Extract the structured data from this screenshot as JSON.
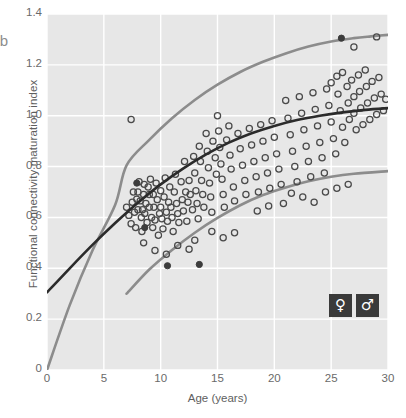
{
  "panel": {
    "letter": "b"
  },
  "axes": {
    "x": {
      "label": "Age (years)",
      "ticks": [
        0,
        5,
        10,
        15,
        20,
        25,
        30
      ],
      "min": 0,
      "max": 30
    },
    "y": {
      "label": "Functional connectivity maturation index",
      "ticks": [
        "0",
        "0.2",
        "0.4",
        "0.6",
        "0.8",
        "1.0",
        "1.2",
        "1.4"
      ],
      "tick_values": [
        0,
        0.2,
        0.4,
        0.6,
        0.8,
        1.0,
        1.2,
        1.4
      ],
      "min": 0,
      "max": 1.4
    }
  },
  "legend": {
    "position": "bottom-right",
    "items": [
      {
        "name": "female",
        "glyph": "♀",
        "box_color": "#3a3a3a",
        "glyph_color": "#ffffff"
      },
      {
        "name": "male",
        "glyph": "♂",
        "box_color": "#3a3a3a",
        "glyph_color": "#ffffff"
      }
    ]
  },
  "style": {
    "plot_background": "#e7e7e7",
    "gridline_color": "#ffffff",
    "page_background": "#ffffff",
    "marker_edge_color": "#4a4a4a",
    "marker_fill": "none",
    "marker_filled_color": "#3c3c3c",
    "marker_radius": 3.1,
    "fit_color": "#2b2b2b",
    "band_color": "#8c8c8c",
    "tick_text_color": "#6a6a6a",
    "axis_label_color": "#5e5e5e"
  },
  "chart_data": {
    "type": "scatter",
    "title": "",
    "subtitle": "",
    "xlabel": "Age (years)",
    "ylabel": "Functional connectivity maturation index",
    "xlim": [
      0,
      30
    ],
    "ylim": [
      0,
      1.4
    ],
    "grid": true,
    "legend_position": "bottom right",
    "legend_entries": [
      "♀",
      "♂"
    ],
    "series": [
      {
        "name": "participants",
        "type": "scatter",
        "marker": "open-circle",
        "points": [
          [
            7.4,
            0.985
          ],
          [
            7.0,
            0.64
          ],
          [
            7.2,
            0.608
          ],
          [
            7.4,
            0.575
          ],
          [
            7.5,
            0.66
          ],
          [
            7.6,
            0.7
          ],
          [
            7.7,
            0.62
          ],
          [
            7.8,
            0.56
          ],
          [
            7.9,
            0.672
          ],
          [
            8.0,
            0.63
          ],
          [
            8.0,
            0.7
          ],
          [
            8.1,
            0.74
          ],
          [
            8.2,
            0.665
          ],
          [
            8.3,
            0.6
          ],
          [
            8.35,
            0.545
          ],
          [
            8.4,
            0.63
          ],
          [
            8.5,
            0.69
          ],
          [
            8.55,
            0.73
          ],
          [
            8.6,
            0.615
          ],
          [
            8.7,
            0.655
          ],
          [
            8.8,
            0.58
          ],
          [
            8.9,
            0.72
          ],
          [
            9.0,
            0.64
          ],
          [
            9.0,
            0.69
          ],
          [
            9.1,
            0.75
          ],
          [
            9.2,
            0.6
          ],
          [
            9.3,
            0.56
          ],
          [
            9.35,
            0.69
          ],
          [
            9.4,
            0.64
          ],
          [
            9.5,
            0.59
          ],
          [
            9.6,
            0.735
          ],
          [
            9.7,
            0.67
          ],
          [
            9.8,
            0.53
          ],
          [
            9.9,
            0.615
          ],
          [
            10.0,
            0.705
          ],
          [
            10.0,
            0.64
          ],
          [
            10.1,
            0.595
          ],
          [
            10.2,
            0.555
          ],
          [
            10.3,
            0.68
          ],
          [
            10.4,
            0.755
          ],
          [
            10.5,
            0.62
          ],
          [
            10.6,
            0.585
          ],
          [
            10.7,
            0.66
          ],
          [
            10.8,
            0.72
          ],
          [
            10.9,
            0.64
          ],
          [
            11.0,
            0.6
          ],
          [
            11.1,
            0.545
          ],
          [
            11.2,
            0.7
          ],
          [
            11.3,
            0.77
          ],
          [
            11.4,
            0.655
          ],
          [
            11.5,
            0.615
          ],
          [
            11.6,
            0.58
          ],
          [
            11.8,
            0.74
          ],
          [
            11.9,
            0.67
          ],
          [
            12.0,
            0.625
          ],
          [
            12.1,
            0.82
          ],
          [
            12.2,
            0.7
          ],
          [
            12.3,
            0.585
          ],
          [
            12.4,
            0.66
          ],
          [
            12.5,
            0.745
          ],
          [
            12.6,
            0.69
          ],
          [
            12.8,
            0.63
          ],
          [
            12.9,
            0.84
          ],
          [
            13.0,
            0.775
          ],
          [
            13.1,
            0.705
          ],
          [
            13.2,
            0.655
          ],
          [
            13.3,
            0.595
          ],
          [
            13.4,
            0.88
          ],
          [
            13.5,
            0.82
          ],
          [
            13.6,
            0.745
          ],
          [
            13.7,
            0.69
          ],
          [
            13.8,
            0.64
          ],
          [
            14.0,
            0.93
          ],
          [
            14.1,
            0.86
          ],
          [
            14.2,
            0.795
          ],
          [
            14.3,
            0.735
          ],
          [
            14.4,
            0.68
          ],
          [
            14.5,
            0.62
          ],
          [
            14.6,
            0.9
          ],
          [
            14.8,
            0.835
          ],
          [
            14.9,
            0.77
          ],
          [
            15.0,
            1.0
          ],
          [
            15.1,
            0.94
          ],
          [
            15.2,
            0.875
          ],
          [
            15.3,
            0.81
          ],
          [
            15.4,
            0.75
          ],
          [
            15.5,
            0.69
          ],
          [
            15.6,
            0.64
          ],
          [
            15.8,
            0.905
          ],
          [
            16.0,
            0.96
          ],
          [
            16.1,
            0.845
          ],
          [
            16.2,
            0.79
          ],
          [
            16.4,
            0.72
          ],
          [
            16.5,
            0.665
          ],
          [
            16.8,
            0.93
          ],
          [
            17.0,
            0.87
          ],
          [
            17.2,
            0.805
          ],
          [
            17.4,
            0.745
          ],
          [
            17.5,
            0.69
          ],
          [
            17.8,
            0.95
          ],
          [
            18.0,
            0.885
          ],
          [
            18.2,
            0.82
          ],
          [
            18.4,
            0.76
          ],
          [
            18.6,
            0.7
          ],
          [
            18.8,
            0.965
          ],
          [
            19.0,
            0.9
          ],
          [
            19.2,
            0.835
          ],
          [
            19.4,
            0.775
          ],
          [
            19.6,
            0.715
          ],
          [
            19.8,
            0.98
          ],
          [
            20.0,
            0.915
          ],
          [
            20.2,
            0.85
          ],
          [
            20.4,
            0.79
          ],
          [
            20.6,
            0.73
          ],
          [
            20.8,
            0.655
          ],
          [
            21.0,
            1.06
          ],
          [
            21.2,
            0.99
          ],
          [
            21.4,
            0.925
          ],
          [
            21.6,
            0.86
          ],
          [
            21.8,
            0.8
          ],
          [
            22.0,
            0.74
          ],
          [
            22.2,
            1.075
          ],
          [
            22.4,
            1.01
          ],
          [
            22.6,
            0.945
          ],
          [
            22.8,
            0.88
          ],
          [
            23.0,
            0.82
          ],
          [
            23.2,
            0.76
          ],
          [
            23.4,
            1.09
          ],
          [
            23.6,
            1.025
          ],
          [
            23.8,
            0.96
          ],
          [
            24.0,
            0.895
          ],
          [
            24.2,
            0.835
          ],
          [
            24.4,
            0.775
          ],
          [
            24.6,
            1.105
          ],
          [
            24.8,
            1.04
          ],
          [
            25.0,
            0.975
          ],
          [
            25.0,
            1.13
          ],
          [
            25.2,
            0.91
          ],
          [
            25.4,
            0.85
          ],
          [
            25.5,
            1.155
          ],
          [
            25.6,
            1.085
          ],
          [
            25.8,
            1.02
          ],
          [
            26.0,
            0.955
          ],
          [
            26.0,
            1.17
          ],
          [
            26.2,
            0.895
          ],
          [
            26.4,
            1.115
          ],
          [
            26.5,
            1.05
          ],
          [
            26.6,
            0.985
          ],
          [
            26.8,
            1.14
          ],
          [
            27.0,
            1.075
          ],
          [
            27.0,
            1.01
          ],
          [
            27.2,
            0.945
          ],
          [
            27.4,
            1.16
          ],
          [
            27.5,
            1.095
          ],
          [
            27.6,
            1.03
          ],
          [
            27.8,
            0.965
          ],
          [
            28.0,
            1.18
          ],
          [
            28.1,
            1.115
          ],
          [
            28.2,
            1.05
          ],
          [
            28.4,
            0.985
          ],
          [
            28.6,
            1.135
          ],
          [
            28.8,
            1.07
          ],
          [
            29.0,
            1.005
          ],
          [
            29.2,
            1.15
          ],
          [
            29.4,
            1.085
          ],
          [
            29.6,
            1.02
          ],
          [
            29.8,
            1.065
          ],
          [
            21.5,
            0.695
          ],
          [
            22.5,
            0.68
          ],
          [
            23.5,
            0.66
          ],
          [
            19.5,
            0.645
          ],
          [
            18.5,
            0.625
          ],
          [
            24.5,
            0.7
          ],
          [
            25.5,
            0.715
          ],
          [
            26.5,
            0.73
          ],
          [
            16.5,
            0.54
          ],
          [
            15.5,
            0.52
          ],
          [
            13.0,
            0.51
          ],
          [
            11.5,
            0.49
          ],
          [
            12.5,
            0.475
          ],
          [
            14.5,
            0.545
          ],
          [
            9.5,
            0.47
          ],
          [
            10.5,
            0.455
          ],
          [
            8.5,
            0.5
          ],
          [
            29.0,
            1.31
          ],
          [
            27.0,
            1.27
          ]
        ],
        "filled_points": [
          [
            10.6,
            0.41
          ],
          [
            7.9,
            0.735
          ],
          [
            13.4,
            0.415
          ],
          [
            8.6,
            0.56
          ],
          [
            25.9,
            1.305
          ]
        ]
      }
    ],
    "fit_curves": [
      {
        "name": "mean-fit",
        "color": "#2b2b2b",
        "width": 2.6,
        "description": "central fitted growth curve",
        "points": [
          [
            0,
            0.305
          ],
          [
            2,
            0.4
          ],
          [
            4,
            0.492
          ],
          [
            6,
            0.578
          ],
          [
            8,
            0.658
          ],
          [
            10,
            0.73
          ],
          [
            12,
            0.793
          ],
          [
            14,
            0.848
          ],
          [
            16,
            0.894
          ],
          [
            18,
            0.931
          ],
          [
            20,
            0.96
          ],
          [
            22,
            0.983
          ],
          [
            24,
            1.0
          ],
          [
            26,
            1.013
          ],
          [
            28,
            1.023
          ],
          [
            30,
            1.03
          ]
        ]
      },
      {
        "name": "upper-band",
        "color": "#8c8c8c",
        "width": 2.6,
        "description": "upper confidence/percentile curve",
        "points": [
          [
            0,
            0.0
          ],
          [
            2,
            0.255
          ],
          [
            4,
            0.47
          ],
          [
            6,
            0.65
          ],
          [
            7,
            0.805
          ],
          [
            9,
            0.905
          ],
          [
            11,
            0.99
          ],
          [
            13,
            1.062
          ],
          [
            15,
            1.122
          ],
          [
            17,
            1.172
          ],
          [
            19,
            1.212
          ],
          [
            21,
            1.245
          ],
          [
            23,
            1.272
          ],
          [
            25,
            1.292
          ],
          [
            27,
            1.305
          ],
          [
            28.5,
            1.312
          ],
          [
            30,
            1.318
          ]
        ]
      },
      {
        "name": "lower-band",
        "color": "#8c8c8c",
        "width": 2.6,
        "description": "lower confidence/percentile curve",
        "points": [
          [
            7,
            0.3
          ],
          [
            9,
            0.395
          ],
          [
            11,
            0.472
          ],
          [
            13,
            0.54
          ],
          [
            15,
            0.598
          ],
          [
            17,
            0.648
          ],
          [
            19,
            0.688
          ],
          [
            21,
            0.718
          ],
          [
            23,
            0.742
          ],
          [
            25,
            0.76
          ],
          [
            27,
            0.772
          ],
          [
            30,
            0.782
          ]
        ]
      }
    ]
  }
}
